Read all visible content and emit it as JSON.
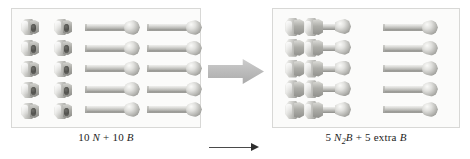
{
  "figure": {
    "left_panel": {
      "name": "reactants-panel",
      "caption_html": "10 <i>N</i> + 10 <i>B</i>",
      "caption_text": "10 N + 10 B",
      "groups": [
        {
          "name": "nuts",
          "icon": "hex-nut-icon",
          "columns": 2,
          "rows": 5,
          "count": 10,
          "symbol": "N"
        },
        {
          "name": "bolts",
          "icon": "bolt-icon",
          "columns": 2,
          "rows": 5,
          "count": 10,
          "symbol": "B"
        }
      ]
    },
    "right_panel": {
      "name": "products-panel",
      "caption_html": "5 <i>N</i><sub>2</sub><i>B</i> + 5 extra <i>B</i>",
      "caption_text": "5 N2B + 5 extra B",
      "groups": [
        {
          "name": "assemblies",
          "icon": "nut-bolt-assembly-icon",
          "columns": 1,
          "rows": 5,
          "count": 5,
          "symbol": "N2B",
          "nuts_per_assembly": 2
        },
        {
          "name": "leftover-bolts",
          "icon": "bolt-icon",
          "columns": 1,
          "rows": 5,
          "count": 5,
          "symbol": "B"
        }
      ]
    },
    "arrow": {
      "name": "reaction-arrow",
      "icon": "right-arrow-icon",
      "direction": "right",
      "color": "#bdbdbd"
    },
    "bottom_rule": {
      "name": "bottom-rule",
      "icon": "thin-right-arrow-icon",
      "color": "#3a3a3a"
    },
    "colors": {
      "panel_background": "#fbfbfa",
      "panel_border": "#d8d8d6",
      "metal_light": "#f4f4f2",
      "metal_mid": "#b9b9b5",
      "metal_dark": "#8c8c88",
      "page_background": "#ffffff",
      "caption_text": "#1d1d1d"
    }
  }
}
